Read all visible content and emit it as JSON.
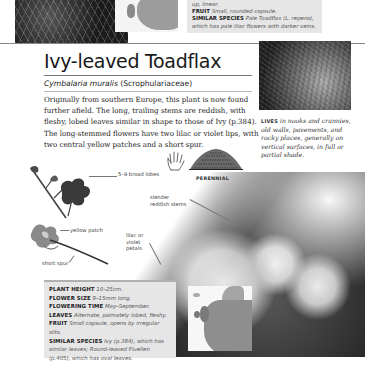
{
  "previous_entry": {
    "info_lines": [
      {
        "key": "",
        "value": "up, linear."
      },
      {
        "key": "FRUIT",
        "value": "Small, rounded capsule."
      },
      {
        "key": "SIMILAR SPECIES",
        "value": "Pale Toadflax (L. repens),"
      },
      {
        "key": "",
        "value": "which has pale lilac flowers with darker veins."
      }
    ]
  },
  "entry": {
    "common_name": "Ivy-leaved Toadflax",
    "latin_name": "Cymbalaria muralis",
    "family": "(Scrophulariaceae)",
    "description": "Originally from southern Europe, this plant is now found further afield. The long, trailing stems are reddish, with fleshy, lobed leaves similar in shape to those of Ivy (p.384). The long-stemmed flowers have two lilac or violet lips, with two central yellow patches and a short spur.",
    "habitat": {
      "lead": "LIVES",
      "text": " in nooks and crannies, old walls, pavements, and rocky places, generally on vertical surfaces, in full or partial shade."
    },
    "life_cycle": "PERENNIAL",
    "annotations": {
      "lobes": "5–9 broad lobes",
      "stems": "slender reddish stems",
      "yellow_patch": "yellow patch",
      "petals": "lilac or violet petals",
      "spur": "short spur"
    },
    "facts": [
      {
        "key": "PLANT HEIGHT",
        "value": "10–25cm."
      },
      {
        "key": "FLOWER SIZE",
        "value": "9–15mm long."
      },
      {
        "key": "FLOWERING TIME",
        "value": "May–September."
      },
      {
        "key": "LEAVES",
        "value": "Alternate, palmately lobed, fleshy."
      },
      {
        "key": "FRUIT",
        "value": "Small capsule, opens by irregular slits."
      },
      {
        "key": "SIMILAR SPECIES",
        "value": "Ivy (p.384), which has similar leaves; Round-leaved Fluellen (p.405), which has oval leaves."
      }
    ]
  },
  "icons": {
    "hand": "hand-icon",
    "perennial": "perennial-plant-icon",
    "map": "distribution-map"
  }
}
